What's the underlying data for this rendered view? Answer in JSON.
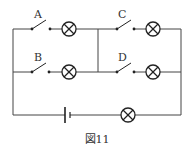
{
  "diagram": {
    "type": "circuit",
    "caption": "図11",
    "switches": [
      {
        "label": "A",
        "branch": "left-top"
      },
      {
        "label": "B",
        "branch": "left-bottom"
      },
      {
        "label": "C",
        "branch": "right-top"
      },
      {
        "label": "D",
        "branch": "right-bottom"
      }
    ],
    "components": {
      "lamps": 5,
      "battery": 1,
      "switches": 4
    },
    "colors": {
      "line": "#444444",
      "background": "#ffffff"
    }
  }
}
